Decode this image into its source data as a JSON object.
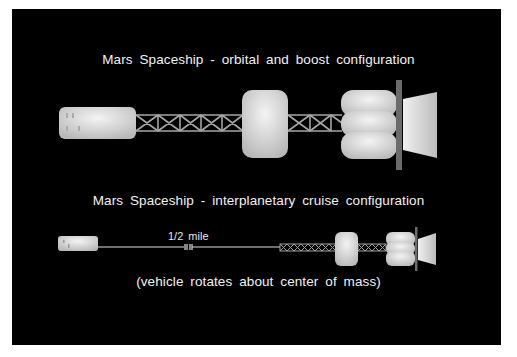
{
  "diagram": {
    "title_boost": "Mars Spaceship - orbital and boost configuration",
    "title_cruise": "Mars Spaceship - interplanetary cruise configuration",
    "tether_length_label": "1/2 mile",
    "rotation_note": "(vehicle rotates about center of mass)",
    "colors": {
      "background": "#000000",
      "module_fill": "#d9d9d9",
      "truss": "#9a9a9a",
      "thrust_plate": "#6b6b6b",
      "text": "#f2f2f2"
    }
  }
}
